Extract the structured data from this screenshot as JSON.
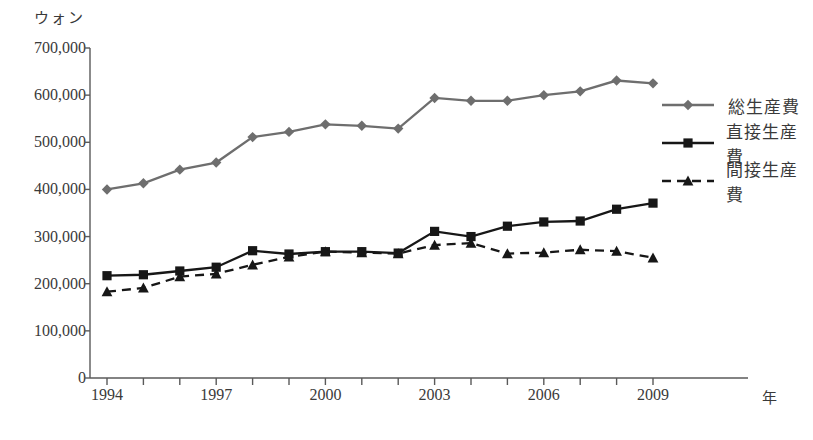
{
  "axes": {
    "y_unit_label": "ウォン",
    "x_unit_label": "年",
    "y_ticks": [
      "700,000",
      "600,000",
      "500,000",
      "400,000",
      "300,000",
      "200,000",
      "100,000",
      "0"
    ],
    "x_ticks_labeled": [
      "1994",
      "1997",
      "2000",
      "2003",
      "2006",
      "2009"
    ]
  },
  "legend": {
    "items": [
      {
        "label": "総生産費",
        "marker": "diamond",
        "color": "#6e6e6e",
        "dashed": false
      },
      {
        "label": "直接生産費",
        "marker": "square",
        "color": "#171717",
        "dashed": false
      },
      {
        "label": "間接生産費",
        "marker": "triangle",
        "color": "#171717",
        "dashed": true
      }
    ]
  },
  "chart_data": {
    "type": "line",
    "title": "",
    "xlabel": "年",
    "ylabel": "ウォン",
    "ylim": [
      0,
      700000
    ],
    "ytick_step": 100000,
    "grid": false,
    "legend_position": "right",
    "x": [
      1994,
      1995,
      1996,
      1997,
      1998,
      1999,
      2000,
      2001,
      2002,
      2003,
      2004,
      2005,
      2006,
      2007,
      2008,
      2009
    ],
    "series": [
      {
        "name": "総生産費",
        "marker": "diamond",
        "color": "#6e6e6e",
        "dashed": false,
        "values": [
          400000,
          413000,
          442000,
          457000,
          511000,
          522000,
          538000,
          535000,
          529000,
          594000,
          588000,
          588000,
          600000,
          608000,
          631000,
          625000
        ]
      },
      {
        "name": "直接生産費",
        "marker": "square",
        "color": "#171717",
        "dashed": false,
        "values": [
          217000,
          219000,
          227000,
          235000,
          270000,
          263000,
          268000,
          268000,
          265000,
          311000,
          300000,
          322000,
          331000,
          333000,
          358000,
          371000
        ]
      },
      {
        "name": "間接生産費",
        "marker": "triangle",
        "color": "#171717",
        "dashed": true,
        "values": [
          183000,
          191000,
          215000,
          221000,
          240000,
          257000,
          268000,
          266000,
          264000,
          282000,
          286000,
          264000,
          266000,
          272000,
          269000,
          255000
        ]
      }
    ]
  }
}
